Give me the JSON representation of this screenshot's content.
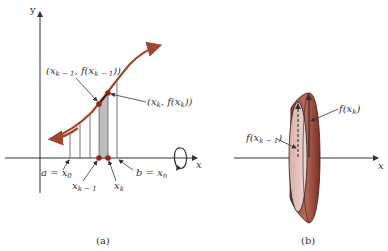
{
  "figure": {
    "panel_a": {
      "caption": "(a)",
      "y_axis_label": "y",
      "x_axis_label": "x",
      "labels": {
        "left_point": {
          "open": "(",
          "x": "x",
          "x_sub": "k − 1",
          "comma_f": ", f(x",
          "f_sub": "k − 1",
          "close": "))"
        },
        "right_point": {
          "open": "(",
          "x": "x",
          "x_sub": "k",
          "comma_f": ", f(x",
          "f_sub": "k",
          "close": "))"
        },
        "a_eq": "a = x",
        "a_sub": "0",
        "b_eq": "b = x",
        "b_sub": "n",
        "xk1": "x",
        "xk1_sub": "k − 1",
        "xk": "x",
        "xk_sub": "k"
      },
      "rotation_icon": "rotation-arrow-icon"
    },
    "panel_b": {
      "caption": "(b)",
      "x_axis_label": "x",
      "labels": {
        "f_xk": "f(x",
        "f_xk_sub": "k",
        "f_xk_close": ")",
        "f_xk1": "f(x",
        "f_xk1_sub": "k − 1",
        "f_xk1_close": ")"
      }
    },
    "colors": {
      "curve": "#a0452e",
      "point": "#8e2a1c",
      "shade": "#bdbdbd",
      "axis": "#333333",
      "frustum_light": "#e6c9c3",
      "frustum_dark": "#a35a4a"
    }
  }
}
